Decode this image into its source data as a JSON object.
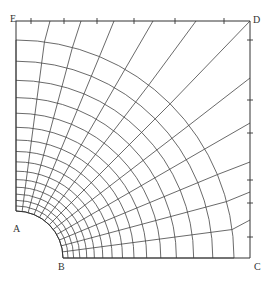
{
  "diagram": {
    "type": "finite-element-mesh",
    "labels": {
      "A": {
        "text": "A",
        "x": 13,
        "y": 224
      },
      "B": {
        "text": "B",
        "x": 58,
        "y": 262
      },
      "C": {
        "text": "C",
        "x": 254,
        "y": 262
      },
      "D": {
        "text": "D",
        "x": 253,
        "y": 14
      },
      "E": {
        "text": "E",
        "x": 11,
        "y": 13
      }
    },
    "geometry": {
      "center": [
        16,
        258
      ],
      "hole_radius": 47,
      "outer_radius": 218,
      "corner_E": [
        16,
        21
      ],
      "corner_D": [
        250,
        21
      ],
      "corner_C": [
        250,
        258
      ],
      "arc_count": 16,
      "radial_count": 13,
      "line_color": "#444444"
    },
    "top_edge": {
      "ticks_x": [
        31,
        64,
        97,
        134,
        175,
        224
      ],
      "line_ends_x": [
        50,
        81,
        114,
        153,
        196,
        250
      ]
    },
    "right_edge": {
      "ticks_y": [
        40,
        100,
        133,
        180,
        203,
        237
      ],
      "line_ends_y": [
        78,
        123,
        162,
        192,
        220
      ]
    }
  }
}
